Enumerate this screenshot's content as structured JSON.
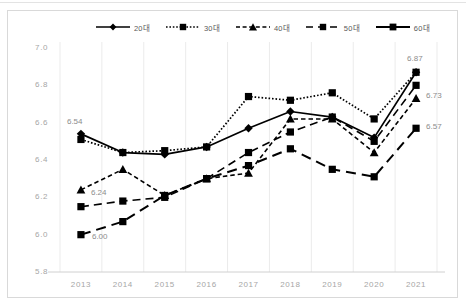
{
  "chart_data": {
    "type": "line",
    "title": "",
    "xlabel": "",
    "ylabel": "",
    "categories": [
      "2013",
      "2014",
      "2015",
      "2016",
      "2017",
      "2018",
      "2019",
      "2020",
      "2021"
    ],
    "ylim": [
      5.8,
      7.0
    ],
    "ytick_labels": [
      "7.0",
      "6.8",
      "6.6",
      "6.4",
      "6.2",
      "6.0",
      "5.8"
    ],
    "ytick_values": [
      7.0,
      6.8,
      6.6,
      6.4,
      6.2,
      6.0,
      5.8
    ],
    "grid": "vertical",
    "legend_position": "top",
    "series": [
      {
        "name": "20대",
        "marker": "diamond",
        "line": "solid",
        "values": [
          6.54,
          6.44,
          6.43,
          6.47,
          6.57,
          6.66,
          6.63,
          6.52,
          6.87
        ]
      },
      {
        "name": "30대",
        "marker": "square",
        "line": "dotted",
        "values": [
          6.51,
          6.44,
          6.45,
          6.47,
          6.74,
          6.72,
          6.76,
          6.62,
          6.87
        ]
      },
      {
        "name": "40대",
        "marker": "triangle",
        "line": "dashed",
        "values": [
          6.24,
          6.35,
          6.21,
          6.3,
          6.33,
          6.62,
          6.62,
          6.44,
          6.73
        ]
      },
      {
        "name": "50대",
        "marker": "square",
        "line": "dashed",
        "values": [
          6.15,
          6.18,
          6.2,
          6.3,
          6.44,
          6.55,
          6.63,
          6.5,
          6.8
        ]
      },
      {
        "name": "60대",
        "marker": "square",
        "line": "solid",
        "values": [
          6.0,
          6.07,
          6.21,
          6.3,
          6.37,
          6.46,
          6.35,
          6.31,
          6.57
        ]
      }
    ],
    "data_labels": [
      {
        "text": "6.54",
        "series": "20대",
        "category": "2013",
        "value": 6.54
      },
      {
        "text": "6.24",
        "series": "40대",
        "category": "2013",
        "value": 6.24
      },
      {
        "text": "6.00",
        "series": "60대",
        "category": "2013",
        "value": 6.0
      },
      {
        "text": "6.87",
        "series": "20대",
        "category": "2021",
        "value": 6.87
      },
      {
        "text": "6.73",
        "series": "40대",
        "category": "2021",
        "value": 6.73
      },
      {
        "text": "6.57",
        "series": "60대",
        "category": "2021",
        "value": 6.57
      }
    ]
  },
  "colors": {
    "series": "#000000",
    "axis_text": "#a6a6a6",
    "label_text": "#8c8c8c",
    "grid": "#ebebeb",
    "border": "#d9d9d9"
  }
}
